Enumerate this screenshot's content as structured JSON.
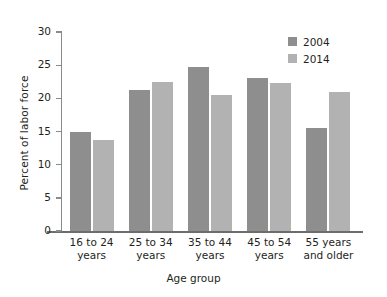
{
  "chart_data": {
    "type": "bar",
    "title": "",
    "xlabel": "Age group",
    "ylabel": "Percent of labor force",
    "categories": [
      "16 to 24 years",
      "25 to 34 years",
      "35 to 44 years",
      "45 to 54 years",
      "55 years and older"
    ],
    "category_lines": [
      [
        "16 to 24",
        "years"
      ],
      [
        "25 to 34",
        "years"
      ],
      [
        "35 to 44",
        "years"
      ],
      [
        "45 to 54",
        "years"
      ],
      [
        "55  years",
        "and older"
      ]
    ],
    "series": [
      {
        "name": "2004",
        "color": "#8e8e8e",
        "values": [
          15.0,
          21.3,
          24.7,
          23.1,
          15.5
        ]
      },
      {
        "name": "2014",
        "color": "#b2b2b2",
        "values": [
          13.7,
          22.5,
          20.5,
          22.3,
          21.0
        ]
      }
    ],
    "ylim": [
      0,
      30
    ],
    "yticks": [
      0,
      5,
      10,
      15,
      20,
      25,
      30
    ],
    "ytick_labels": [
      "0",
      "5",
      "10",
      "15",
      "20",
      "25",
      "30"
    ],
    "grid": false,
    "legend_position": "top-right",
    "legend_entries": [
      "2004",
      "2014"
    ]
  }
}
